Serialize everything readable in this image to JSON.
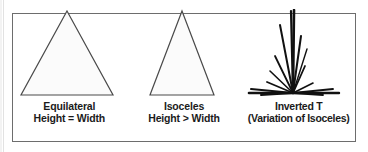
{
  "figure": {
    "border_color": "#6d6d6d",
    "background_color": "#ffffff",
    "stroke_color": "#3a3a3a",
    "ink_color": "#111111",
    "text_color": "#1b1b1b"
  },
  "panels": [
    {
      "id": "equilateral",
      "shape": "triangle",
      "icon_name": "equilateral-triangle-shape",
      "caption_line1": "Equilateral",
      "caption_line2": "Height = Width",
      "geometry": {
        "apex_x": 50,
        "apex_y": 2,
        "base_left_x": 4,
        "base_right_x": 96,
        "base_y": 86,
        "fill": "#fbfbfb",
        "stroke": "#4a4a4a",
        "stroke_width": 1.2
      }
    },
    {
      "id": "isoceles",
      "shape": "triangle",
      "icon_name": "isoceles-triangle-shape",
      "caption_line1": "Isoceles",
      "caption_line2": "Height > Width",
      "geometry": {
        "apex_x": 50,
        "apex_y": 2,
        "base_left_x": 18,
        "base_right_x": 82,
        "base_y": 86,
        "fill": "#fbfbfb",
        "stroke": "#4a4a4a",
        "stroke_width": 1.2
      }
    },
    {
      "id": "inverted-t",
      "shape": "radiating-lines",
      "icon_name": "inverted-t-spatter-shape",
      "caption_line1": "Inverted T",
      "caption_line2": "(Variation of Isoceles)",
      "geometry": {
        "origin_x": 46,
        "origin_y": 84,
        "fill": "none",
        "stroke": "#111111",
        "rays": [
          {
            "x2": 47,
            "y2": 1,
            "w": 2.6
          },
          {
            "x2": 44,
            "y2": 2,
            "w": 2.2
          },
          {
            "x2": 33,
            "y2": 16,
            "w": 2.0
          },
          {
            "x2": 54,
            "y2": 27,
            "w": 2.0
          },
          {
            "x2": 28,
            "y2": 47,
            "w": 1.8
          },
          {
            "x2": 58,
            "y2": 57,
            "w": 1.8
          },
          {
            "x2": 23,
            "y2": 62,
            "w": 1.6
          },
          {
            "x2": 20,
            "y2": 73,
            "w": 1.8
          },
          {
            "x2": 66,
            "y2": 74,
            "w": 1.6
          },
          {
            "x2": 4,
            "y2": 80,
            "w": 2.0
          },
          {
            "x2": 2,
            "y2": 84,
            "w": 2.6
          },
          {
            "x2": 86,
            "y2": 80,
            "w": 1.8
          },
          {
            "x2": 92,
            "y2": 84,
            "w": 2.4
          },
          {
            "x2": 14,
            "y2": 86,
            "w": 2.0
          },
          {
            "x2": 76,
            "y2": 86,
            "w": 1.8
          },
          {
            "x2": 60,
            "y2": 40,
            "w": 1.4
          }
        ]
      }
    }
  ]
}
